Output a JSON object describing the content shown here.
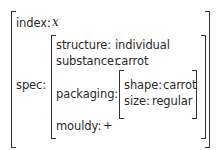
{
  "avm": {
    "index": {
      "label": "index:",
      "value": "x"
    },
    "spec": {
      "label": "spec:",
      "structure": {
        "label": "structure:",
        "value": "individual"
      },
      "substance": {
        "label": "substance:",
        "value": "carrot"
      },
      "packaging": {
        "label": "packaging:",
        "shape": {
          "label": "shape:",
          "value": "carrot"
        },
        "size": {
          "label": "size:",
          "value": "regular"
        }
      },
      "mouldy": {
        "label": "mouldy:",
        "value": "+"
      }
    }
  }
}
